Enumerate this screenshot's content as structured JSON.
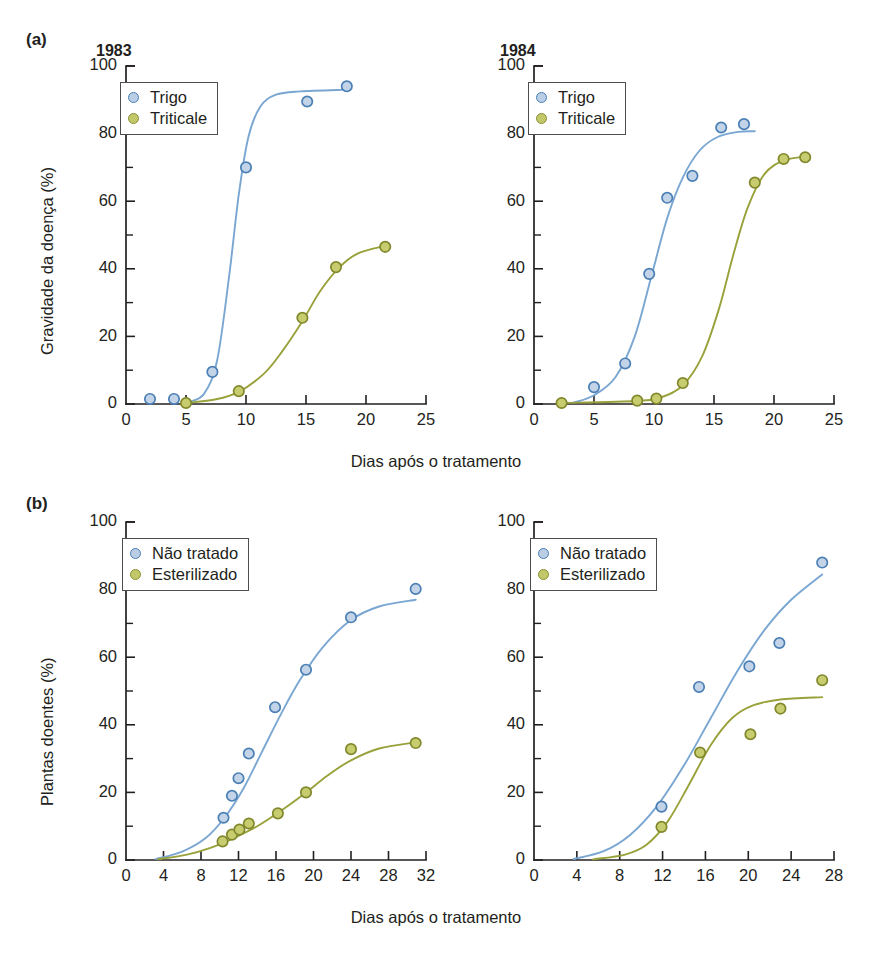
{
  "figure": {
    "panels": [
      {
        "tag": "(a)",
        "ylabel": "Gravidade da doença (%)",
        "xlabel": "Dias após o tratamento",
        "charts": [
          "a_left",
          "a_right"
        ]
      },
      {
        "tag": "(b)",
        "ylabel": "Plantas doentes (%)",
        "xlabel": "Dias após o tratamento",
        "charts": [
          "b_left",
          "b_right"
        ]
      }
    ]
  },
  "colors": {
    "blue_marker_fill": "#c3d4e8",
    "blue_marker_edge": "#4a7fb5",
    "blue_curve": "#7aa6d2",
    "olive_marker_fill": "#c7cc6e",
    "olive_marker_edge": "#81882c",
    "olive_curve": "#99a13a",
    "axis": "#231f20"
  },
  "chart_data": [
    {
      "id": "a_left",
      "type": "scatter",
      "title": "1983",
      "panel": "(a)",
      "xlabel": "Dias após o tratamento",
      "ylabel": "Gravidade da doença (%)",
      "xlim": [
        0,
        25
      ],
      "ylim": [
        0,
        100
      ],
      "xticks": [
        0,
        5,
        10,
        15,
        20,
        25
      ],
      "yticks": [
        0,
        20,
        40,
        60,
        80,
        100
      ],
      "xminor_step": 2.5,
      "yminor_step": 10,
      "grid": false,
      "legend_position": "upper-left",
      "series": [
        {
          "name": "Trigo",
          "color": "#4a7fb5",
          "points": [
            {
              "x": 2.0,
              "y": 1.5
            },
            {
              "x": 4.0,
              "y": 1.5
            },
            {
              "x": 7.2,
              "y": 9.5
            },
            {
              "x": 10.0,
              "y": 70.0
            },
            {
              "x": 15.1,
              "y": 89.5
            },
            {
              "x": 18.4,
              "y": 94.0
            }
          ],
          "fit_curve": [
            {
              "x": 5.2,
              "y": 0.6
            },
            {
              "x": 6.5,
              "y": 3.0
            },
            {
              "x": 7.6,
              "y": 13.0
            },
            {
              "x": 8.6,
              "y": 38.0
            },
            {
              "x": 9.4,
              "y": 62.0
            },
            {
              "x": 10.2,
              "y": 79.0
            },
            {
              "x": 11.2,
              "y": 88.0
            },
            {
              "x": 12.5,
              "y": 91.5
            },
            {
              "x": 14.5,
              "y": 92.5
            },
            {
              "x": 18.4,
              "y": 93.0
            }
          ]
        },
        {
          "name": "Triticale",
          "color": "#81882c",
          "points": [
            {
              "x": 5.0,
              "y": 0.3
            },
            {
              "x": 9.4,
              "y": 3.8
            },
            {
              "x": 14.7,
              "y": 25.5
            },
            {
              "x": 17.5,
              "y": 40.5
            },
            {
              "x": 21.6,
              "y": 46.5
            }
          ],
          "fit_curve": [
            {
              "x": 5.0,
              "y": 0.3
            },
            {
              "x": 7.5,
              "y": 1.4
            },
            {
              "x": 9.4,
              "y": 3.6
            },
            {
              "x": 11.5,
              "y": 9.0
            },
            {
              "x": 13.0,
              "y": 15.5
            },
            {
              "x": 14.7,
              "y": 24.5
            },
            {
              "x": 16.2,
              "y": 33.5
            },
            {
              "x": 17.8,
              "y": 40.5
            },
            {
              "x": 19.3,
              "y": 44.5
            },
            {
              "x": 21.6,
              "y": 46.8
            }
          ]
        }
      ]
    },
    {
      "id": "a_right",
      "type": "scatter",
      "title": "1984",
      "panel": "(a)",
      "xlabel": "Dias após o tratamento",
      "ylabel": "Gravidade da doença (%)",
      "xlim": [
        0,
        25
      ],
      "ylim": [
        0,
        100
      ],
      "xticks": [
        0,
        5,
        10,
        15,
        20,
        25
      ],
      "yticks": [
        0,
        20,
        40,
        60,
        80,
        100
      ],
      "xminor_step": 2.5,
      "yminor_step": 10,
      "grid": false,
      "legend_position": "upper-left",
      "series": [
        {
          "name": "Trigo",
          "color": "#4a7fb5",
          "points": [
            {
              "x": 5.0,
              "y": 5.0
            },
            {
              "x": 7.6,
              "y": 12.0
            },
            {
              "x": 9.6,
              "y": 38.5
            },
            {
              "x": 11.1,
              "y": 61.0
            },
            {
              "x": 13.2,
              "y": 67.5
            },
            {
              "x": 15.6,
              "y": 81.8
            },
            {
              "x": 17.5,
              "y": 82.8
            }
          ],
          "fit_curve": [
            {
              "x": 3.3,
              "y": 0.4
            },
            {
              "x": 5.0,
              "y": 2.6
            },
            {
              "x": 6.8,
              "y": 8.0
            },
            {
              "x": 8.4,
              "y": 20.0
            },
            {
              "x": 9.8,
              "y": 38.0
            },
            {
              "x": 11.1,
              "y": 55.0
            },
            {
              "x": 12.4,
              "y": 67.0
            },
            {
              "x": 13.8,
              "y": 75.0
            },
            {
              "x": 15.3,
              "y": 79.0
            },
            {
              "x": 17.0,
              "y": 80.5
            },
            {
              "x": 18.4,
              "y": 80.7
            }
          ]
        },
        {
          "name": "Triticale",
          "color": "#81882c",
          "points": [
            {
              "x": 2.3,
              "y": 0.3
            },
            {
              "x": 8.6,
              "y": 1.0
            },
            {
              "x": 10.2,
              "y": 1.6
            },
            {
              "x": 12.4,
              "y": 6.2
            },
            {
              "x": 18.4,
              "y": 65.5
            },
            {
              "x": 20.8,
              "y": 72.5
            },
            {
              "x": 22.6,
              "y": 73.0
            }
          ],
          "fit_curve": [
            {
              "x": 2.3,
              "y": 0.3
            },
            {
              "x": 8.6,
              "y": 0.9
            },
            {
              "x": 10.6,
              "y": 2.0
            },
            {
              "x": 12.4,
              "y": 5.5
            },
            {
              "x": 14.0,
              "y": 14.0
            },
            {
              "x": 15.4,
              "y": 28.0
            },
            {
              "x": 16.6,
              "y": 44.0
            },
            {
              "x": 17.8,
              "y": 58.0
            },
            {
              "x": 19.2,
              "y": 68.0
            },
            {
              "x": 20.8,
              "y": 72.0
            },
            {
              "x": 22.6,
              "y": 73.2
            }
          ]
        }
      ]
    },
    {
      "id": "b_left",
      "type": "scatter",
      "title": "",
      "panel": "(b)",
      "xlabel": "Dias após o tratamento",
      "ylabel": "Plantas doentes (%)",
      "xlim": [
        0,
        32
      ],
      "ylim": [
        0,
        100
      ],
      "xticks": [
        0,
        4,
        8,
        12,
        16,
        20,
        24,
        28,
        32
      ],
      "yticks": [
        0,
        20,
        40,
        60,
        80,
        100
      ],
      "xminor_step": 2,
      "yminor_step": 10,
      "grid": false,
      "legend_position": "upper-left",
      "series": [
        {
          "name": "Não tratado",
          "color": "#4a7fb5",
          "points": [
            {
              "x": 10.4,
              "y": 12.5
            },
            {
              "x": 11.3,
              "y": 19.0
            },
            {
              "x": 12.0,
              "y": 24.2
            },
            {
              "x": 13.1,
              "y": 31.5
            },
            {
              "x": 15.9,
              "y": 45.2
            },
            {
              "x": 19.2,
              "y": 56.3
            },
            {
              "x": 24.0,
              "y": 71.8
            },
            {
              "x": 30.9,
              "y": 80.2
            }
          ],
          "fit_curve": [
            {
              "x": 3.2,
              "y": 0.3
            },
            {
              "x": 6.0,
              "y": 2.5
            },
            {
              "x": 8.5,
              "y": 6.5
            },
            {
              "x": 10.5,
              "y": 12.5
            },
            {
              "x": 12.5,
              "y": 21.0
            },
            {
              "x": 14.5,
              "y": 32.0
            },
            {
              "x": 16.5,
              "y": 43.0
            },
            {
              "x": 18.5,
              "y": 53.0
            },
            {
              "x": 21.0,
              "y": 63.0
            },
            {
              "x": 24.0,
              "y": 71.0
            },
            {
              "x": 27.0,
              "y": 75.0
            },
            {
              "x": 30.9,
              "y": 77.0
            }
          ]
        },
        {
          "name": "Esterilizado",
          "color": "#81882c",
          "points": [
            {
              "x": 10.3,
              "y": 5.5
            },
            {
              "x": 11.3,
              "y": 7.5
            },
            {
              "x": 12.1,
              "y": 9.0
            },
            {
              "x": 13.1,
              "y": 10.8
            },
            {
              "x": 16.2,
              "y": 13.8
            },
            {
              "x": 19.2,
              "y": 20.0
            },
            {
              "x": 24.0,
              "y": 32.8
            },
            {
              "x": 30.9,
              "y": 34.6
            }
          ],
          "fit_curve": [
            {
              "x": 3.4,
              "y": 0.2
            },
            {
              "x": 6.5,
              "y": 1.6
            },
            {
              "x": 9.0,
              "y": 3.6
            },
            {
              "x": 11.5,
              "y": 6.5
            },
            {
              "x": 14.0,
              "y": 10.0
            },
            {
              "x": 16.5,
              "y": 14.5
            },
            {
              "x": 19.0,
              "y": 19.5
            },
            {
              "x": 21.5,
              "y": 25.0
            },
            {
              "x": 24.0,
              "y": 29.5
            },
            {
              "x": 27.0,
              "y": 33.0
            },
            {
              "x": 30.9,
              "y": 34.8
            }
          ]
        }
      ]
    },
    {
      "id": "b_right",
      "type": "scatter",
      "title": "",
      "panel": "(b)",
      "xlabel": "Dias após o tratamento",
      "ylabel": "Plantas doentes (%)",
      "xlim": [
        0,
        28
      ],
      "ylim": [
        0,
        100
      ],
      "xticks": [
        0,
        4,
        8,
        12,
        16,
        20,
        24,
        28
      ],
      "yticks": [
        0,
        20,
        40,
        60,
        80,
        100
      ],
      "xminor_step": 2,
      "yminor_step": 10,
      "grid": false,
      "legend_position": "upper-left",
      "series": [
        {
          "name": "Não tratado",
          "color": "#4a7fb5",
          "points": [
            {
              "x": 11.9,
              "y": 15.8
            },
            {
              "x": 15.4,
              "y": 51.2
            },
            {
              "x": 20.1,
              "y": 57.3
            },
            {
              "x": 22.9,
              "y": 64.2
            },
            {
              "x": 26.9,
              "y": 88.0
            }
          ],
          "fit_curve": [
            {
              "x": 3.7,
              "y": 0.3
            },
            {
              "x": 6.5,
              "y": 2.6
            },
            {
              "x": 9.0,
              "y": 7.5
            },
            {
              "x": 11.5,
              "y": 16.0
            },
            {
              "x": 14.0,
              "y": 28.0
            },
            {
              "x": 16.5,
              "y": 42.0
            },
            {
              "x": 19.0,
              "y": 56.0
            },
            {
              "x": 21.5,
              "y": 68.0
            },
            {
              "x": 24.0,
              "y": 77.0
            },
            {
              "x": 26.9,
              "y": 84.5
            }
          ]
        },
        {
          "name": "Esterilizado",
          "color": "#81882c",
          "points": [
            {
              "x": 11.9,
              "y": 9.8
            },
            {
              "x": 15.5,
              "y": 31.8
            },
            {
              "x": 20.2,
              "y": 37.2
            },
            {
              "x": 23.0,
              "y": 44.8
            },
            {
              "x": 26.9,
              "y": 53.2
            }
          ],
          "fit_curve": [
            {
              "x": 5.5,
              "y": 0.2
            },
            {
              "x": 8.5,
              "y": 1.6
            },
            {
              "x": 10.5,
              "y": 4.5
            },
            {
              "x": 12.5,
              "y": 11.5
            },
            {
              "x": 14.5,
              "y": 22.5
            },
            {
              "x": 16.5,
              "y": 34.0
            },
            {
              "x": 18.5,
              "y": 42.0
            },
            {
              "x": 20.5,
              "y": 45.8
            },
            {
              "x": 23.0,
              "y": 47.5
            },
            {
              "x": 26.9,
              "y": 48.2
            }
          ]
        }
      ]
    }
  ]
}
